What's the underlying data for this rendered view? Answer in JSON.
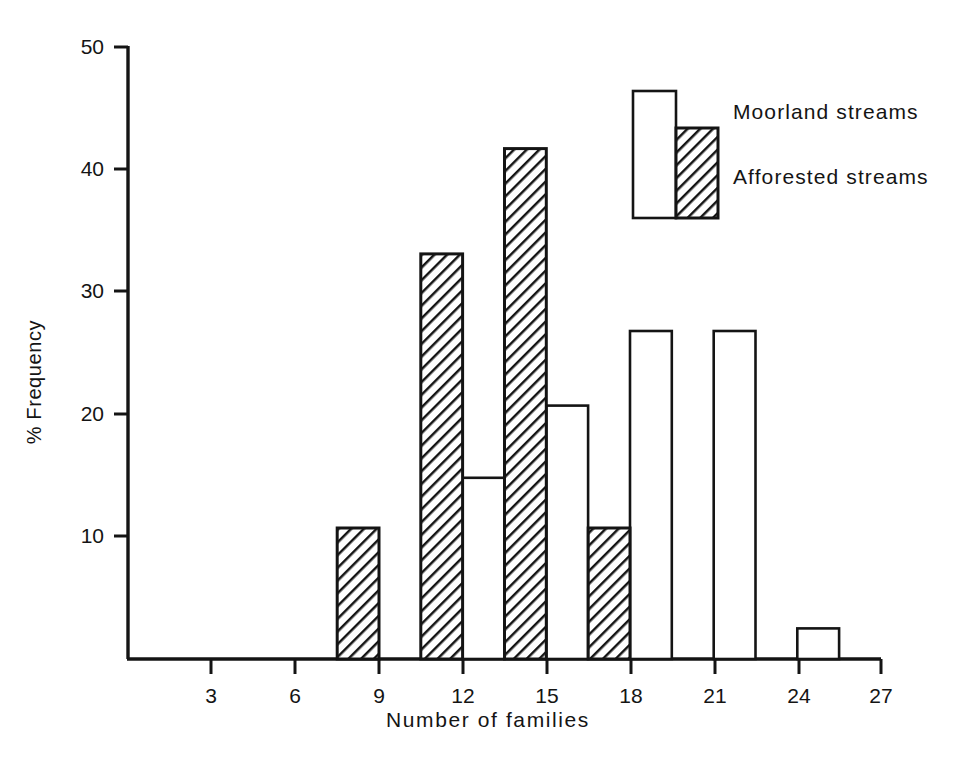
{
  "chart_data": {
    "type": "bar",
    "title": "",
    "xlabel": "Number of families",
    "ylabel": "% Frequency",
    "xlim": [
      0,
      27
    ],
    "ylim": [
      0,
      50
    ],
    "xticks": [
      3,
      6,
      9,
      12,
      15,
      18,
      21,
      24,
      27
    ],
    "yticks": [
      10,
      20,
      30,
      40,
      50
    ],
    "grid": false,
    "legend_position": "top-right",
    "bar_width": 1.5,
    "series": [
      {
        "name": "Moorland streams",
        "fill": "white",
        "bins": [
          {
            "start": 12,
            "end": 13.5,
            "value": 14.8
          },
          {
            "start": 15,
            "end": 16.5,
            "value": 20.7
          },
          {
            "start": 18,
            "end": 19.5,
            "value": 26.8
          },
          {
            "start": 21,
            "end": 22.5,
            "value": 26.8
          },
          {
            "start": 24,
            "end": 25.5,
            "value": 2.5
          }
        ]
      },
      {
        "name": "Afforested streams",
        "fill": "hatched",
        "bins": [
          {
            "start": 7.5,
            "end": 9,
            "value": 10.7
          },
          {
            "start": 10.5,
            "end": 12,
            "value": 33.1
          },
          {
            "start": 13.5,
            "end": 15,
            "value": 41.7
          },
          {
            "start": 16.5,
            "end": 18,
            "value": 10.7
          }
        ]
      }
    ]
  },
  "axes": {
    "y_title": "% Frequency",
    "x_title": "Number of families",
    "y_tick_labels": [
      "50",
      "40",
      "30",
      "20",
      "10"
    ],
    "x_tick_labels": [
      "3",
      "6",
      "9",
      "12",
      "15",
      "18",
      "21",
      "24",
      "27"
    ]
  },
  "legend": {
    "moorland_label": "Moorland streams",
    "afforested_label": "Afforested streams"
  },
  "colors": {
    "ink": "#141414",
    "background": "#ffffff"
  }
}
